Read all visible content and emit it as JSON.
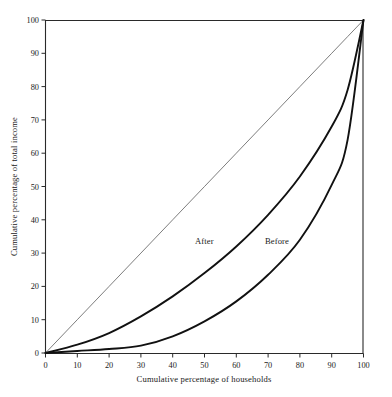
{
  "chart_data": {
    "type": "line",
    "title": "",
    "subtitle": "",
    "xlabel": "Cumulative percentage of households",
    "ylabel": "Cumulative percentage of total income",
    "xlim": [
      0,
      100
    ],
    "ylim": [
      0,
      100
    ],
    "grid": false,
    "legend_position": "inline-annotation",
    "xticks": [
      0,
      10,
      20,
      30,
      40,
      50,
      60,
      70,
      80,
      90,
      100
    ],
    "yticks": [
      0,
      10,
      20,
      30,
      40,
      50,
      60,
      70,
      80,
      90,
      100
    ],
    "xtick_labels": [
      "0",
      "10",
      "20",
      "30",
      "40",
      "50",
      "60",
      "70",
      "80",
      "90",
      "100"
    ],
    "ytick_labels": [
      "0",
      "10",
      "20",
      "30",
      "40",
      "50",
      "60",
      "70",
      "80",
      "90",
      "100"
    ],
    "x": [
      0,
      10,
      20,
      30,
      40,
      50,
      60,
      70,
      80,
      90,
      95,
      100
    ],
    "series": [
      {
        "name": "Line of equality",
        "annotation": "",
        "color": "#5c5c5c",
        "width": 0.8,
        "values": [
          0,
          10,
          20,
          30,
          40,
          50,
          60,
          70,
          80,
          90,
          95,
          100
        ]
      },
      {
        "name": "After",
        "annotation": "After",
        "color": "#111111",
        "width": 1.9,
        "values": [
          0,
          2.5,
          6.0,
          11.0,
          17.0,
          24.0,
          32.0,
          41.5,
          53.0,
          68.0,
          79.0,
          100
        ]
      },
      {
        "name": "Before",
        "annotation": "Before",
        "color": "#111111",
        "width": 1.9,
        "values": [
          0,
          0.6,
          1.2,
          2.2,
          5.0,
          9.5,
          15.5,
          23.5,
          34.0,
          50.5,
          64.0,
          100
        ]
      }
    ],
    "annotations": [
      {
        "text": "After",
        "x": 50,
        "y": 34
      },
      {
        "text": "Before",
        "x": 72,
        "y": 34
      }
    ]
  },
  "axes": {
    "x_title": "Cumulative percentage of households",
    "y_title": "Cumulative percentage of total income"
  },
  "labels": {
    "after": "After",
    "before": "Before"
  },
  "ticks": {
    "x": [
      "0",
      "10",
      "20",
      "30",
      "40",
      "50",
      "60",
      "70",
      "80",
      "90",
      "100"
    ],
    "y": [
      "0",
      "10",
      "20",
      "30",
      "40",
      "50",
      "60",
      "70",
      "80",
      "90",
      "100"
    ]
  },
  "colors": {
    "curve": "#111111",
    "equality": "#5c5c5c",
    "axis": "#2a2a2a",
    "background": "#ffffff"
  }
}
